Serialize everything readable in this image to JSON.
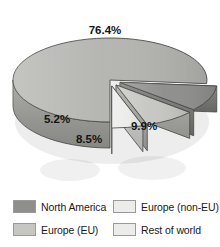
{
  "chart_data": {
    "type": "pie",
    "title": "",
    "subtitle": "",
    "xlabel": "",
    "ylabel": "",
    "three_d": true,
    "exploded_slices": [
      "North America",
      "Europe (EU)",
      "Europe (non-EU)"
    ],
    "legend_position": "bottom",
    "grid": false,
    "categories": [
      "Rest of world",
      "North America",
      "Europe (EU)",
      "Europe (non-EU)"
    ],
    "values": [
      76.4,
      9.9,
      8.5,
      5.2
    ],
    "data_labels": [
      "76.4%",
      "9.9%",
      "8.5%",
      "5.2%"
    ],
    "slices": [
      {
        "label": "Rest of world",
        "value": 76.4,
        "data_label": "76.4%",
        "color": "#b4b4b0",
        "side_color": "#9d9d99",
        "exploded": false
      },
      {
        "label": "North America",
        "value": 9.9,
        "data_label": "9.9%",
        "color": "#8e8e8c",
        "side_color": "#777774",
        "exploded": true
      },
      {
        "label": "Europe (EU)",
        "value": 8.5,
        "data_label": "8.5%",
        "color": "#c6c6c2",
        "side_color": "#a9a9a5",
        "exploded": true
      },
      {
        "label": "Europe (non-EU)",
        "value": 5.2,
        "data_label": "5.2%",
        "color": "#ececeb",
        "side_color": "#cfcfcc",
        "exploded": true
      }
    ]
  },
  "labels": {
    "rest_of_world": "76.4%",
    "north_america": "9.9%",
    "europe_eu": "8.5%",
    "europe_non_eu": "5.2%"
  },
  "legend": {
    "items": [
      {
        "label": "North America",
        "color": "#8e8e8c"
      },
      {
        "label": "Europe (non-EU)",
        "color": "#ececeb"
      },
      {
        "label": "Europe (EU)",
        "color": "#c6c6c2"
      },
      {
        "label": "Rest of world",
        "color": "#ececea"
      }
    ]
  },
  "colors": {
    "background": "#ffffff",
    "outline": "#4a4a48",
    "text": "#141414"
  }
}
